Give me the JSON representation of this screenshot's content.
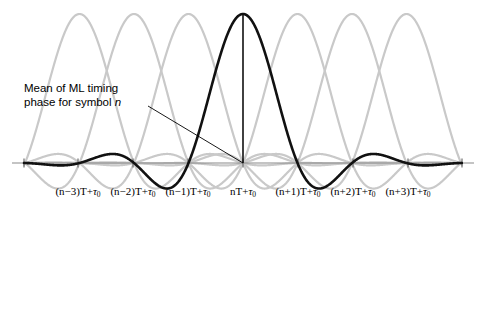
{
  "figure": {
    "name": "ml-timing-phase-correlation-diagram",
    "annotation": {
      "line1": "Mean of ML timing",
      "line2_prefix": "phase for symbol ",
      "line2_symbol": "n"
    },
    "colors": {
      "dark_curve": "#111111",
      "gray_curve": "#c9c9c9",
      "axis": "#8a8a8a",
      "marker": "#111111",
      "leader": "#000000",
      "background": "#ffffff"
    }
  },
  "chart_data": {
    "type": "line",
    "title": "",
    "subtitle": "",
    "xlabel": "",
    "ylabel": "",
    "grid": false,
    "legend": false,
    "x_unit": "T",
    "axis_baseline_y": 163,
    "tick_spacing_px": 54.5,
    "xlim": [
      -3.9,
      3.9
    ],
    "ylim": [
      -1.07,
      1.07
    ],
    "tick_labels": [
      {
        "index": -3,
        "text_parts": {
          "prefix": "(n−3)T+",
          "tau": "τ",
          "sub": "0"
        },
        "x": 78
      },
      {
        "index": -2,
        "text_parts": {
          "prefix": "(n−2)T+",
          "tau": "τ",
          "sub": "0"
        },
        "x": 133
      },
      {
        "index": -1,
        "text_parts": {
          "prefix": "(n−1)T+",
          "tau": "τ",
          "sub": "0"
        },
        "x": 188
      },
      {
        "index": 0,
        "text_parts": {
          "prefix": "nT+",
          "tau": "τ",
          "sub": "0"
        },
        "x": 243
      },
      {
        "index": 1,
        "text_parts": {
          "prefix": "(n+1)T+",
          "tau": "τ",
          "sub": "0"
        },
        "x": 298
      },
      {
        "index": 2,
        "text_parts": {
          "prefix": "(n+2)T+",
          "tau": "τ",
          "sub": "0"
        },
        "x": 353
      },
      {
        "index": 3,
        "text_parts": {
          "prefix": "(n+3)T+",
          "tau": "τ",
          "sub": "0"
        },
        "x": 408
      }
    ],
    "tick_marks_x": [
      24,
      78,
      133,
      188,
      243,
      298,
      353,
      408,
      462
    ],
    "series": [
      {
        "name": "symbol n (mean ML timing phase)",
        "color": "#111111",
        "width": 2.6,
        "shift": 0,
        "peak_value": 1.0,
        "peak_x": 243,
        "peak_y": 14,
        "description": "dark sinc-like autocorrelation pulse centred at nT+tau0"
      },
      {
        "name": "symbol n-1 contribution",
        "color": "#c9c9c9",
        "width": 2.2,
        "shift": -1,
        "peak_value": 1.0,
        "peak_x": 188,
        "peak_y": 18
      },
      {
        "name": "symbol n+1 contribution",
        "color": "#c9c9c9",
        "width": 2.2,
        "shift": 1,
        "peak_value": 1.0,
        "peak_x": 298,
        "peak_y": 18
      },
      {
        "name": "symbol n-2 contribution",
        "color": "#c9c9c9",
        "width": 2.2,
        "shift": -2,
        "peak_value": 1.0,
        "peak_x": 133,
        "peak_y": 18
      },
      {
        "name": "symbol n+2 contribution",
        "color": "#c9c9c9",
        "width": 2.2,
        "shift": 2,
        "peak_value": 1.0,
        "peak_x": 353,
        "peak_y": 18
      },
      {
        "name": "symbol n-3 contribution",
        "color": "#c9c9c9",
        "width": 2.2,
        "shift": -3,
        "peak_value": 1.0,
        "peak_x": 78,
        "peak_y": 18
      },
      {
        "name": "symbol n+3 contribution",
        "color": "#c9c9c9",
        "width": 2.2,
        "shift": 3,
        "peak_value": 1.0,
        "peak_x": 408,
        "peak_y": 18
      }
    ],
    "peak_marker": {
      "x": 243,
      "y_top": 14,
      "y_bottom": 163
    },
    "leader_line": {
      "x1": 148,
      "y1": 106,
      "x2": 243,
      "y2": 163
    }
  }
}
